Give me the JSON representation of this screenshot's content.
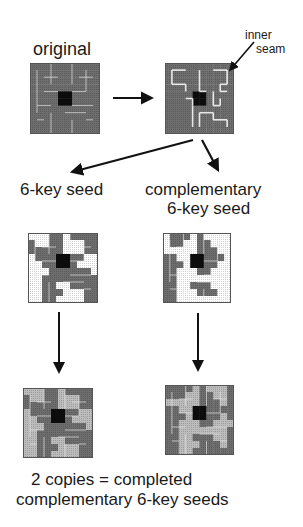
{
  "labels": {
    "original": "original",
    "inner_seam_1": "inner",
    "inner_seam_2": "seam",
    "seed": "6-key seed",
    "comp_1": "complementary",
    "comp_2": "6-key seed",
    "footer_1": "2 copies = completed",
    "footer_2": "complementary 6-key seeds"
  },
  "colors": {
    "dark": "#6e6e6e",
    "light": "#bdbdbd",
    "white": "#ffffff",
    "center": "#0d0d0d",
    "seam": "#e8e8e8",
    "arrow": "#111111"
  },
  "grids": {
    "original": [
      "DDDDDDDDDD",
      "DDDDDDDDDD",
      "DDDDDDDDDD",
      "DDDDDDDDDD",
      "DDDDCCDDDD",
      "DDDDCCDDDD",
      "DDDDDDDDDD",
      "DDDDDDDDDD",
      "DDDDDDDDDD",
      "DDDDDDDDDD"
    ],
    "seed": [
      "WWWDDWDDDD",
      "DWWDDWWWDD",
      "DDDDDWWWDD",
      "WDDDCCDDWW",
      "WWDDCCDWWW",
      "WWWDDDDDDW",
      "WWDDDDDDDD",
      "WWDDWWDDDD",
      "WWDDDWWWDD",
      "WWDDWWWWDD"
    ],
    "comp": [
      "WDDDWDWWWW",
      "WDDWWDDWWW",
      "WWWWWDDDWW",
      "DDWWCCDDDW",
      "DDDWCCDDWW",
      "DDWWWDDWWW",
      "DDWWWWWWWW",
      "DDWWDDDWWW",
      "DDWWWDDDWW",
      "DDWWWWWWWW"
    ],
    "done_left": [
      "LLLDDLDDDD",
      "DLLDDLLLDD",
      "DDDDDLLLDD",
      "LDDDCCDDLL",
      "LLDDCCDLLL",
      "LLLDDDDDDL",
      "LLDDDDDDDD",
      "LLDDLLDDDD",
      "LLDDDLLLDD",
      "LLDDLLLLDD"
    ],
    "done_right": [
      "DDDDLDLLLD",
      "DDDLLDDLLD",
      "LLLLLDDDLD",
      "DDLLCCDDDD",
      "DDDLCCDDLD",
      "DDLLLDDLLL",
      "DDLLLLLLLD",
      "DDLLDDDLLD",
      "DDLLLDDDLD",
      "DDLLDDDDDD"
    ]
  }
}
